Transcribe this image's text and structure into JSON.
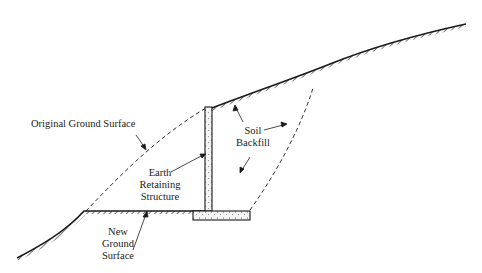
{
  "diagram": {
    "colors": {
      "line": "#1a1a1a",
      "background": "#ffffff",
      "fill": "#f2f2f2"
    },
    "labels": {
      "original_ground": "Original Ground Surface",
      "soil_backfill_1": "Soil",
      "soil_backfill_2": "Backfill",
      "earth_retaining_1": "Earth",
      "earth_retaining_2": "Retaining",
      "earth_retaining_3": "Structure",
      "new_ground_1": "New",
      "new_ground_2": "Ground",
      "new_ground_3": "Surface"
    }
  }
}
